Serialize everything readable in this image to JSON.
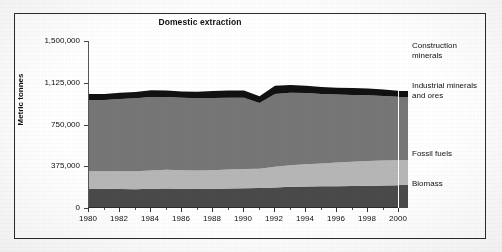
{
  "chart_data": {
    "type": "area",
    "title": "Domestic extraction",
    "xlabel": "",
    "ylabel": "Metric tonnes",
    "stacked": true,
    "grid": true,
    "legend_position": "right",
    "xlim": [
      1980,
      2000
    ],
    "ylim": [
      0,
      1500000
    ],
    "yticks": [
      0,
      375000,
      750000,
      1125000,
      1500000
    ],
    "ytick_labels": [
      "0",
      "375,000",
      "750,000",
      "1,125,000",
      "1,500,000"
    ],
    "xticks": [
      1980,
      1982,
      1984,
      1986,
      1988,
      1990,
      1992,
      1994,
      1996,
      1998,
      2000
    ],
    "xtick_labels": [
      "1980",
      "1982",
      "1984",
      "1986",
      "1988",
      "1990",
      "1992",
      "1994",
      "1996",
      "1998",
      "2000"
    ],
    "x": [
      1980,
      1981,
      1982,
      1983,
      1984,
      1985,
      1986,
      1987,
      1988,
      1989,
      1990,
      1991,
      1992,
      1993,
      1994,
      1995,
      1996,
      1997,
      1998,
      1999,
      2000
    ],
    "series": [
      {
        "name": "Biomass",
        "color": "#4a4a4a",
        "values": [
          170000,
          172000,
          170000,
          168000,
          172000,
          175000,
          172000,
          170000,
          172000,
          175000,
          178000,
          180000,
          185000,
          190000,
          192000,
          195000,
          196000,
          198000,
          200000,
          202000,
          205000
        ]
      },
      {
        "name": "Fossil fuels",
        "color": "#b6b6b6",
        "values": [
          160000,
          158000,
          160000,
          162000,
          165000,
          168000,
          168000,
          166000,
          168000,
          170000,
          172000,
          172000,
          185000,
          195000,
          200000,
          205000,
          212000,
          218000,
          222000,
          224000,
          225000
        ]
      },
      {
        "name": "Industrial minerals and ores",
        "color": "#767676",
        "values": [
          640000,
          640000,
          648000,
          655000,
          660000,
          655000,
          650000,
          650000,
          648000,
          645000,
          640000,
          590000,
          655000,
          650000,
          640000,
          625000,
          612000,
          600000,
          590000,
          580000,
          568000
        ]
      },
      {
        "name": "Construction minerals",
        "color": "#111111",
        "values": [
          55000,
          55000,
          57000,
          58000,
          60000,
          58000,
          57000,
          58000,
          62000,
          65000,
          66000,
          62000,
          72000,
          70000,
          66000,
          62000,
          60000,
          62000,
          62000,
          58000,
          55000
        ]
      }
    ],
    "totals": [
      1025000,
      1025000,
      1035000,
      1043000,
      1057000,
      1056000,
      1047000,
      1044000,
      1050000,
      1055000,
      1056000,
      1004000,
      1097000,
      1105000,
      1098000,
      1087000,
      1080000,
      1078000,
      1074000,
      1064000,
      1053000
    ],
    "legend_entries": [
      {
        "label": "Construction minerals",
        "color": "#111111"
      },
      {
        "label": "Industrial minerals and ores",
        "color": "#767676"
      },
      {
        "label": "Fossil fuels",
        "color": "#b6b6b6"
      },
      {
        "label": "Biomass",
        "color": "#4a4a4a"
      }
    ]
  }
}
